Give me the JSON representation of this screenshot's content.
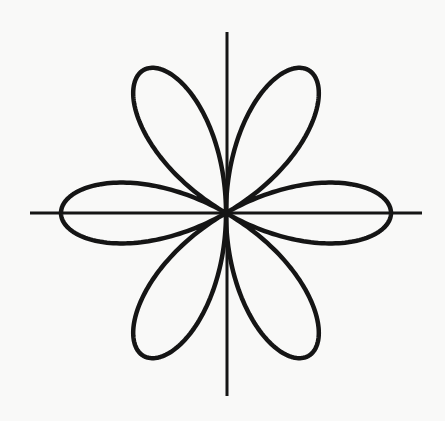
{
  "figure": {
    "type": "polar-rose",
    "equation": "r = a·cos(3θ)",
    "petals": 6,
    "petal_angles_deg": [
      0,
      60,
      120,
      180,
      240,
      300
    ],
    "colors": {
      "background": "#f9f9f8",
      "stroke": "#151515"
    }
  },
  "chart_data": {
    "type": "line",
    "title": "",
    "xlabel": "",
    "ylabel": "",
    "grid": false,
    "legend": null,
    "center_px": [
      226,
      213
    ],
    "petal_length_px": 165,
    "x_axis_px": [
      30,
      422
    ],
    "y_axis_px": [
      32,
      396
    ],
    "series": [
      {
        "name": "rose",
        "theta_deg_step": 2,
        "r_formula": "|cos(3θ)|"
      }
    ]
  }
}
